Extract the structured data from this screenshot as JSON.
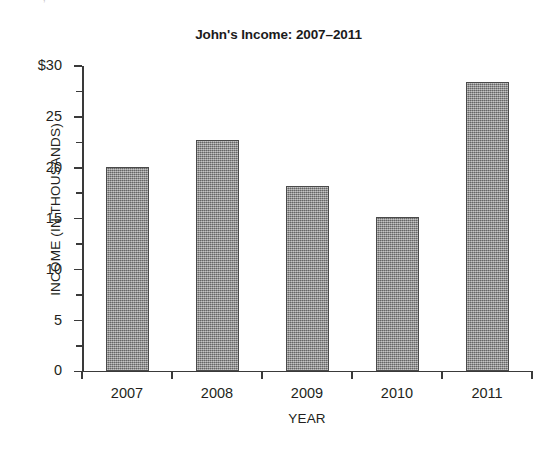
{
  "artifact_text": "·   ·     ,    ·        ·   ·",
  "chart_data": {
    "type": "bar",
    "title": "John's Income: 2007–2011",
    "xlabel": "YEAR",
    "ylabel": "INCOME  (IN THOUSANDS)",
    "categories": [
      "2007",
      "2008",
      "2009",
      "2010",
      "2011"
    ],
    "values": [
      20.1,
      22.7,
      18.2,
      15.2,
      28.4
    ],
    "ylim": [
      0,
      30
    ],
    "ytick_values": [
      0,
      5,
      10,
      15,
      20,
      25,
      30
    ],
    "ytick_labels": [
      "0",
      "5",
      "10",
      "15",
      "20",
      "25",
      "$30"
    ],
    "yminor_tick_values": [
      2.5,
      7.5,
      12.5,
      17.5,
      22.5,
      27.5
    ],
    "grid": false,
    "legend": false,
    "bar_color": "#8d8d8d",
    "bar_edge_color": "#4a4a4a",
    "axis_color": "#3a3a3a",
    "background_color": "#ffffff"
  }
}
